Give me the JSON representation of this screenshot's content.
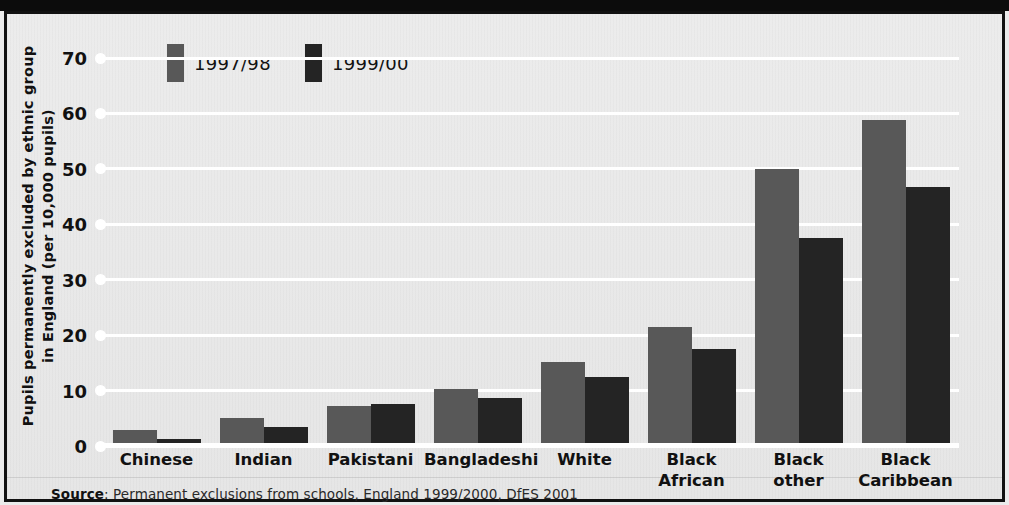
{
  "chart_data": {
    "type": "bar",
    "title": "",
    "xlabel": "",
    "ylabel": "Pupils permanently excluded by ethnic group in England (per 10,000 pupils)",
    "ylim": [
      0,
      70
    ],
    "yticks": [
      0,
      10,
      20,
      30,
      40,
      50,
      60,
      70
    ],
    "ytick_labels": [
      "0",
      "10",
      "20",
      "30",
      "40",
      "50",
      "60",
      "70"
    ],
    "grid": true,
    "legend_position": "top-left",
    "categories": [
      "Chinese",
      "Indian",
      "Pakistani",
      "Bangladeshi",
      "White",
      "Black\nAfrican",
      "Black\nother",
      "Black\nCaribbean"
    ],
    "series": [
      {
        "name": "1997/98",
        "color": "#585858",
        "values": [
          2.9,
          5.0,
          7.2,
          10.3,
          15.2,
          21.5,
          50.0,
          58.8
        ]
      },
      {
        "name": "1999/00",
        "color": "#242424",
        "values": [
          1.3,
          3.5,
          7.6,
          8.6,
          12.4,
          17.5,
          37.6,
          46.7
        ]
      }
    ],
    "source_prefix": "Source",
    "source_text": ": Permanent exclusions from schools, England 1999/2000, DfES 2001"
  },
  "colors": {
    "series_1997_98": "#585858",
    "series_1999_00": "#242424",
    "panel_background": "#e9e9e9",
    "gridline": "#ffffff",
    "frame": "#111111",
    "text": "#111111"
  }
}
